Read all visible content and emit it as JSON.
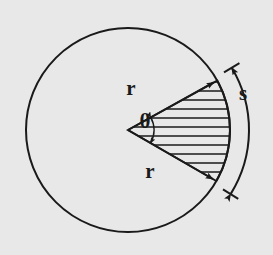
{
  "figure": {
    "background_color": "#e8e8e8",
    "stroke_color": "#1a1a1a",
    "canvas": {
      "width": 273,
      "height": 255
    }
  },
  "circle": {
    "center_x": 128,
    "center_y": 130,
    "radius": 102
  },
  "sector": {
    "start_angle_deg": -29,
    "end_angle_deg": 30,
    "hatch_spacing_px": 9,
    "hatch_orientation": "horizontal"
  },
  "arc_s": {
    "offset_px": 19,
    "start_angle_deg": -31,
    "end_angle_deg": 32,
    "arrowheads": "both"
  },
  "angle_arc": {
    "radius_px": 26,
    "arrowheads": "both"
  },
  "labels": {
    "radius_upper": "r",
    "radius_lower": "r",
    "angle": "θ",
    "arc_length": "s"
  },
  "label_positions": {
    "radius_upper": {
      "x": 131,
      "y": 95
    },
    "radius_lower": {
      "x": 150,
      "y": 178
    },
    "angle": {
      "x": 145,
      "y": 128
    },
    "arc_length": {
      "x": 243,
      "y": 100
    }
  }
}
